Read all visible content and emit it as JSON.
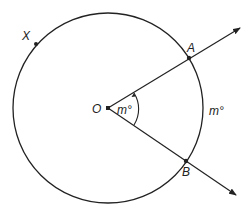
{
  "diagram": {
    "points": {
      "center": "O",
      "point_a": "A",
      "point_b": "B",
      "point_x": "X"
    },
    "angle_label": "m°",
    "arc_label": "m°",
    "colors": {
      "stroke": "#222222",
      "background": "#ffffff"
    }
  }
}
